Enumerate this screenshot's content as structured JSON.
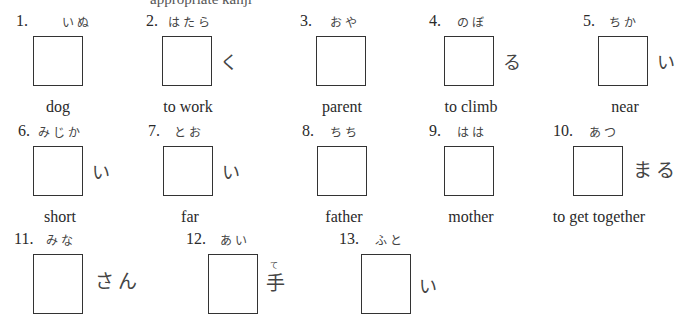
{
  "header": {
    "clipped_text": "appropriate kanji"
  },
  "items": [
    {
      "number": "1.",
      "furigana": "いぬ",
      "okurigana": "",
      "gloss": "dog"
    },
    {
      "number": "2.",
      "furigana": "はたら",
      "okurigana": "く",
      "gloss": "to work"
    },
    {
      "number": "3.",
      "furigana": "おや",
      "okurigana": "",
      "gloss": "parent"
    },
    {
      "number": "4.",
      "furigana": "のぼ",
      "okurigana": "る",
      "gloss": "to climb"
    },
    {
      "number": "5.",
      "furigana": "ちか",
      "okurigana": "い",
      "gloss": "near"
    },
    {
      "number": "6.",
      "furigana": "みじか",
      "okurigana": "い",
      "gloss": "short"
    },
    {
      "number": "7.",
      "furigana": "とお",
      "okurigana": "い",
      "gloss": "far"
    },
    {
      "number": "8.",
      "furigana": "ちち",
      "okurigana": "",
      "gloss": "father"
    },
    {
      "number": "9.",
      "furigana": "はは",
      "okurigana": "",
      "gloss": "mother"
    },
    {
      "number": "10.",
      "furigana": "あつ",
      "okurigana": "まる",
      "gloss": "to get together"
    },
    {
      "number": "11.",
      "furigana": "みな",
      "okurigana": "さん",
      "gloss": ""
    },
    {
      "number": "12.",
      "furigana": "あい",
      "okurigana": "手",
      "okurigana_ruby": "て",
      "gloss": ""
    },
    {
      "number": "13.",
      "furigana": "ふと",
      "okurigana": "い",
      "gloss": ""
    }
  ]
}
